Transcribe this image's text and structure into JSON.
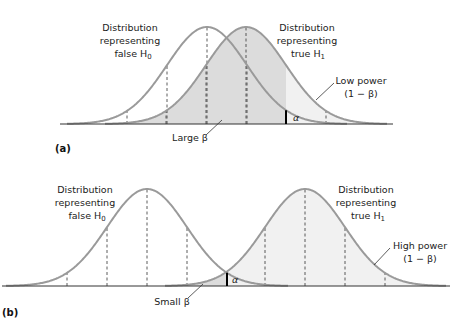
{
  "panels": [
    {
      "id": "a",
      "label": "(a)",
      "axis": {
        "y": 124,
        "x1": 60,
        "x2": 393
      },
      "sigma": 40,
      "amplitude": 97,
      "h0": {
        "mean": 207,
        "x_from": 67,
        "x_to": 347
      },
      "h1": {
        "mean": 246,
        "x_from": 105,
        "x_to": 387
      },
      "critical_x": 286,
      "h0_text": [
        "Distribution",
        "representing",
        "false H",
        "0"
      ],
      "h1_text": [
        "Distribution",
        "representing",
        "true H",
        "1"
      ],
      "power_text": [
        "Low power",
        "(1 − β)"
      ],
      "beta_text": "Large β",
      "alpha_text": "α"
    },
    {
      "id": "b",
      "label": "(b)",
      "axis": {
        "y": 286,
        "x1": 2,
        "x2": 450
      },
      "sigma": 40,
      "amplitude": 97,
      "h0": {
        "mean": 147,
        "x_from": 6,
        "x_to": 288
      },
      "h1": {
        "mean": 305,
        "x_from": 165,
        "x_to": 446
      },
      "critical_x": 227,
      "h0_text": [
        "Distribution",
        "representing",
        "false H",
        "0"
      ],
      "h1_text": [
        "Distribution",
        "representing",
        "true H",
        "1"
      ],
      "power_text": [
        "High power",
        "(1 − β)"
      ],
      "beta_text": "Small β",
      "alpha_text": "α"
    }
  ],
  "colors": {
    "curve": "#9a9a9a",
    "shade": "#dcdcdc",
    "light_shade": "#f1f1f1",
    "axis": "#333333",
    "dash": "#333333",
    "critical": "#000000"
  }
}
